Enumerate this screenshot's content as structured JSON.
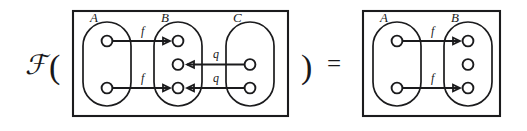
{
  "figure": {
    "kind": "commutative-diagram",
    "functor_symbol": "ℱ",
    "open_paren": "(",
    "close_paren": ")",
    "equals_symbol": "=",
    "left_box": {
      "sets": [
        {
          "label": "A",
          "node_count": 2
        },
        {
          "label": "B",
          "node_count": 3
        },
        {
          "label": "C",
          "node_count": 2
        }
      ],
      "edge_labels": [
        "f",
        "f",
        "q",
        "q"
      ],
      "edges": [
        {
          "label": "f",
          "from_set": "A",
          "from_index": 0,
          "to_set": "B",
          "to_index": 0,
          "direction": "right"
        },
        {
          "label": "f",
          "from_set": "A",
          "from_index": 1,
          "to_set": "B",
          "to_index": 2,
          "direction": "right"
        },
        {
          "label": "q",
          "from_set": "C",
          "from_index": 0,
          "to_set": "B",
          "to_index": 1,
          "direction": "left"
        },
        {
          "label": "q",
          "from_set": "C",
          "from_index": 1,
          "to_set": "B",
          "to_index": 2,
          "direction": "left"
        }
      ]
    },
    "right_box": {
      "sets": [
        {
          "label": "A",
          "node_count": 2
        },
        {
          "label": "B",
          "node_count": 3
        }
      ],
      "edge_labels": [
        "f",
        "f"
      ],
      "edges": [
        {
          "label": "f",
          "from_set": "A",
          "from_index": 0,
          "to_set": "B",
          "to_index": 0,
          "direction": "right"
        },
        {
          "label": "f",
          "from_set": "A",
          "from_index": 1,
          "to_set": "B",
          "to_index": 2,
          "direction": "right"
        }
      ]
    }
  },
  "colors": {
    "ink": "#1b1b1d",
    "paper": "#ffffff"
  }
}
